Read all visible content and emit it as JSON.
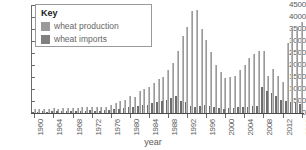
{
  "chart_data": {
    "type": "bar",
    "title": "",
    "xlabel": "year",
    "ylabel": "",
    "ylim": [
      0,
      4500
    ],
    "ytick_step": 500,
    "yticks": [
      0,
      500,
      1000,
      1500,
      2000,
      2500,
      3000,
      3500,
      4000,
      4500
    ],
    "grid": false,
    "legend": {
      "title": "Key",
      "position": "top-left",
      "entries": [
        "wheat production",
        "wheat imports"
      ]
    },
    "xtick_labels": [
      "1960",
      "1964",
      "1968",
      "1972",
      "1976",
      "1980",
      "1984",
      "1988",
      "1992",
      "1996",
      "2000",
      "2004",
      "2008",
      "2012",
      "2016"
    ],
    "xtick_step_years": 4,
    "x_start": 1960,
    "x_end": 2016,
    "x": [
      1960,
      1961,
      1962,
      1963,
      1964,
      1965,
      1966,
      1967,
      1968,
      1969,
      1970,
      1971,
      1972,
      1973,
      1974,
      1975,
      1976,
      1977,
      1978,
      1979,
      1980,
      1981,
      1982,
      1983,
      1984,
      1985,
      1986,
      1987,
      1988,
      1989,
      1990,
      1991,
      1992,
      1993,
      1994,
      1995,
      1996,
      1997,
      1998,
      1999,
      2000,
      2001,
      2002,
      2003,
      2004,
      2005,
      2006,
      2007,
      2008,
      2009,
      2010,
      2011,
      2012,
      2013,
      2014,
      2015,
      2016
    ],
    "series": [
      {
        "name": "wheat production",
        "color": "#9a9a9a",
        "values": [
          160,
          150,
          170,
          150,
          200,
          180,
          190,
          200,
          210,
          200,
          230,
          250,
          260,
          240,
          230,
          250,
          350,
          420,
          500,
          560,
          700,
          680,
          900,
          980,
          1100,
          1250,
          1400,
          1500,
          1800,
          2100,
          2600,
          3200,
          3600,
          4250,
          4300,
          3500,
          3050,
          2550,
          2000,
          1700,
          1450,
          1500,
          1550,
          1800,
          2000,
          2300,
          2450,
          2600,
          2600,
          1550,
          1850,
          1550,
          1300,
          2900,
          3500,
          3600,
          3800
        ]
      },
      {
        "name": "wheat imports",
        "color": "#6e6e6e",
        "values": [
          60,
          55,
          70,
          60,
          80,
          75,
          80,
          85,
          90,
          85,
          95,
          100,
          110,
          100,
          95,
          105,
          130,
          160,
          180,
          200,
          250,
          240,
          300,
          330,
          350,
          400,
          450,
          480,
          560,
          620,
          700,
          500,
          450,
          300,
          250,
          300,
          350,
          300,
          250,
          200,
          180,
          200,
          220,
          250,
          230,
          260,
          280,
          300,
          1100,
          900,
          850,
          700,
          550,
          500,
          450,
          400,
          380
        ]
      }
    ]
  }
}
